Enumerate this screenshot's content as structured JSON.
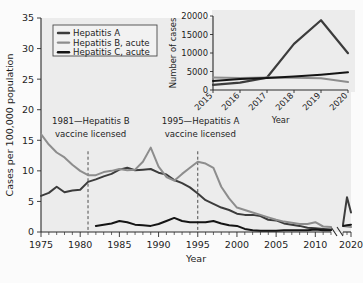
{
  "figure": {
    "background_color": "#fbfbfb",
    "plot_background_color": "#ececec"
  },
  "chart_data": {
    "type": "line",
    "title": "",
    "xlabel": "Year",
    "ylabel": "Cases per 100,000 population",
    "xlim": [
      1975,
      2020
    ],
    "ylim": [
      0,
      35
    ],
    "yticks": [
      0,
      5,
      10,
      15,
      20,
      25,
      30,
      35
    ],
    "xticks": [
      1975,
      1980,
      1985,
      1990,
      1995,
      2000,
      2005,
      2010,
      2020
    ],
    "axis_break": {
      "present": true,
      "between": [
        2012,
        2018
      ]
    },
    "grid": false,
    "legend_position": "top-left",
    "series": [
      {
        "name": "Hepatitis A",
        "color": "#3c3c3c",
        "width": 2.0,
        "x": [
          1975,
          1976,
          1977,
          1978,
          1979,
          1980,
          1981,
          1982,
          1983,
          1984,
          1985,
          1986,
          1987,
          1988,
          1989,
          1990,
          1991,
          1992,
          1993,
          1994,
          1995,
          1996,
          1997,
          1998,
          1999,
          2000,
          2001,
          2002,
          2003,
          2004,
          2005,
          2006,
          2007,
          2008,
          2009,
          2010,
          2011,
          2012,
          2018,
          2019,
          2020
        ],
        "y": [
          5.9,
          6.4,
          7.4,
          6.5,
          6.8,
          6.9,
          8.2,
          8.6,
          9.1,
          9.5,
          10.2,
          10.5,
          10.1,
          10.2,
          10.3,
          9.7,
          9.4,
          8.5,
          8.0,
          7.3,
          6.3,
          5.2,
          4.6,
          4.0,
          3.6,
          3.0,
          2.8,
          2.8,
          2.6,
          2.0,
          1.9,
          1.4,
          1.2,
          1.0,
          0.7,
          0.6,
          0.5,
          0.4,
          1.2,
          5.7,
          3.2
        ]
      },
      {
        "name": "Hepatitis B, acute",
        "color": "#8d8d8d",
        "width": 2.0,
        "x": [
          1975,
          1976,
          1977,
          1978,
          1979,
          1980,
          1981,
          1982,
          1983,
          1984,
          1985,
          1986,
          1987,
          1988,
          1989,
          1990,
          1991,
          1992,
          1993,
          1994,
          1995,
          1996,
          1997,
          1998,
          1999,
          2000,
          2001,
          2002,
          2003,
          2004,
          2005,
          2006,
          2007,
          2008,
          2009,
          2010,
          2011,
          2012,
          2018,
          2019,
          2020
        ],
        "y": [
          16.0,
          14.3,
          13.0,
          12.2,
          11.0,
          10.0,
          9.3,
          9.3,
          9.8,
          10.0,
          10.3,
          10.1,
          10.2,
          11.5,
          13.8,
          10.7,
          9.0,
          8.4,
          9.5,
          10.5,
          11.5,
          11.2,
          10.5,
          7.4,
          5.5,
          4.0,
          3.6,
          3.2,
          2.8,
          2.4,
          2.0,
          1.7,
          1.5,
          1.3,
          1.3,
          1.6,
          0.9,
          0.8,
          1.0,
          0.9,
          0.8
        ]
      },
      {
        "name": "Hepatitis C, acute",
        "color": "#141414",
        "width": 2.0,
        "x": [
          1982,
          1983,
          1984,
          1985,
          1986,
          1987,
          1988,
          1989,
          1990,
          1991,
          1992,
          1993,
          1994,
          1995,
          1996,
          1997,
          1998,
          1999,
          2000,
          2001,
          2002,
          2003,
          2004,
          2005,
          2006,
          2007,
          2008,
          2009,
          2010,
          2011,
          2012,
          2018,
          2019,
          2020
        ],
        "y": [
          1.0,
          1.2,
          1.4,
          1.8,
          1.6,
          1.2,
          1.1,
          1.0,
          1.3,
          1.8,
          2.3,
          1.8,
          1.6,
          1.6,
          1.6,
          1.8,
          1.4,
          1.1,
          1.0,
          0.5,
          0.3,
          0.2,
          0.2,
          0.2,
          0.3,
          0.3,
          0.3,
          0.3,
          0.4,
          0.3,
          0.3,
          1.0,
          1.1,
          1.2
        ]
      }
    ],
    "annotations": [
      {
        "year": 1981,
        "line1": "1981—Hepatitis B",
        "line2": "vaccine licensed"
      },
      {
        "year": 1995,
        "line1": "1995—Hepatitis A",
        "line2": "vaccine licensed"
      }
    ]
  },
  "inset_chart_data": {
    "type": "line",
    "title": "",
    "xlabel": "Year",
    "ylabel": "Number of cases",
    "xlim": [
      2015,
      2020
    ],
    "ylim": [
      0,
      20000
    ],
    "yticks": [
      0,
      5000,
      10000,
      15000,
      20000
    ],
    "xticks": [
      2015,
      2016,
      2017,
      2018,
      2019,
      2020
    ],
    "xtick_rotation": 45,
    "grid": false,
    "series": [
      {
        "name": "Hepatitis A",
        "color": "#3c3c3c",
        "width": 2.2,
        "x": [
          2015,
          2016,
          2017,
          2018,
          2019,
          2020
        ],
        "y": [
          1390,
          2007,
          3366,
          12474,
          18846,
          9952
        ]
      },
      {
        "name": "Hepatitis B, acute",
        "color": "#8d8d8d",
        "width": 2.0,
        "x": [
          2015,
          2016,
          2017,
          2018,
          2019,
          2020
        ],
        "y": [
          3370,
          3218,
          3409,
          3322,
          3192,
          2157
        ]
      },
      {
        "name": "Hepatitis C, acute",
        "color": "#141414",
        "width": 2.0,
        "x": [
          2015,
          2016,
          2017,
          2018,
          2019,
          2020
        ],
        "y": [
          2436,
          2967,
          3216,
          3621,
          4136,
          4798
        ]
      }
    ]
  },
  "legend": {
    "items": [
      {
        "label": "Hepatitis A",
        "color": "#3c3c3c"
      },
      {
        "label": "Hepatitis B, acute",
        "color": "#8d8d8d"
      },
      {
        "label": "Hepatitis C, acute",
        "color": "#141414"
      }
    ]
  }
}
